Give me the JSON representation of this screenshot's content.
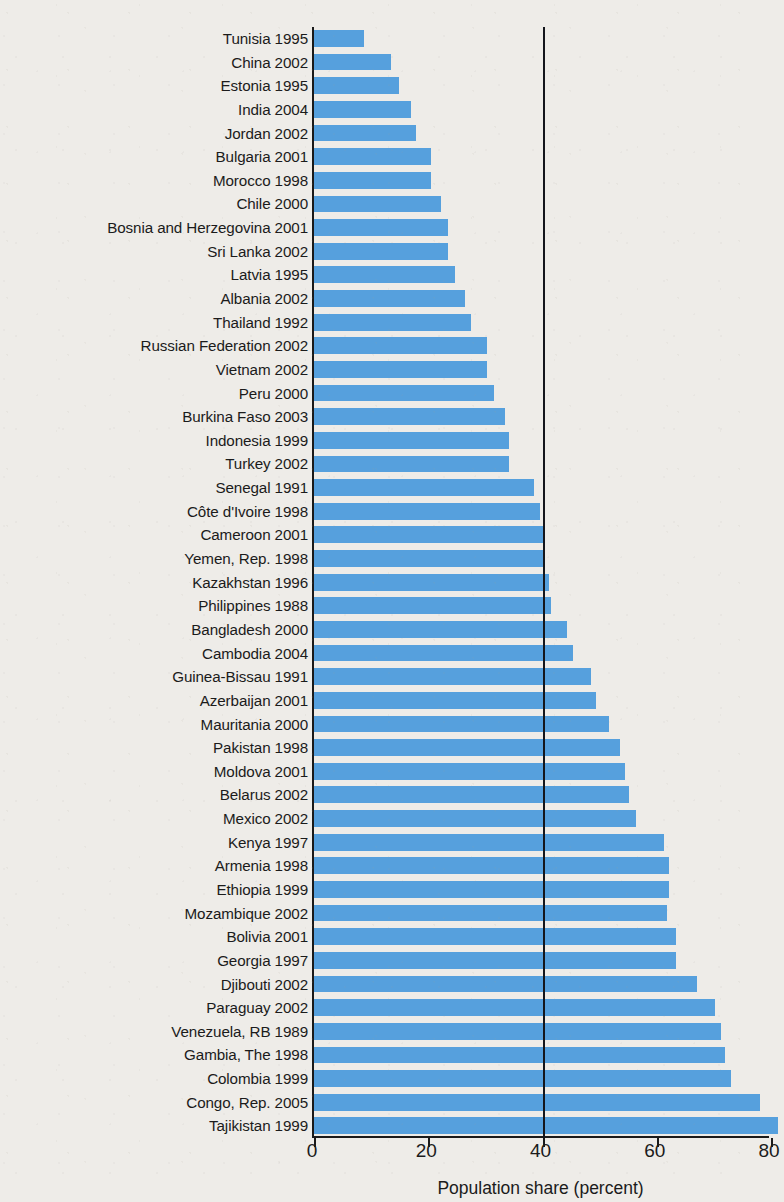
{
  "chart_data": {
    "type": "bar",
    "orientation": "horizontal",
    "title": "",
    "subtitle": "",
    "xlabel": "Population share (percent)",
    "ylabel": "",
    "xlim": [
      0,
      80
    ],
    "xticks": [
      0,
      20,
      40,
      60,
      80
    ],
    "xtick_labels": [
      "0",
      "20",
      "40",
      "60",
      "80"
    ],
    "grid": false,
    "legend": null,
    "bar_color": "#56a0dd",
    "axis_color": "#1a1a1a",
    "background_color": "#eeece8",
    "annotations": [
      {
        "type": "vertical-reference-line",
        "value": 40,
        "color": "#14161c"
      }
    ],
    "categories": [
      "Tunisia 1995",
      "China 2002",
      "Estonia 1995",
      "India 2004",
      "Jordan 2002",
      "Bulgaria 2001",
      "Morocco 1998",
      "Chile 2000",
      "Bosnia and Herzegovina 2001",
      "Sri Lanka 2002",
      "Latvia 1995",
      "Albania 2002",
      "Thailand 1992",
      "Russian Federation 2002",
      "Vietnam 2002",
      "Peru 2000",
      "Burkina Faso 2003",
      "Indonesia 1999",
      "Turkey 2002",
      "Senegal 1991",
      "Côte d'Ivoire 1998",
      "Cameroon 2001",
      "Yemen, Rep. 1998",
      "Kazakhstan 1996",
      "Philippines 1988",
      "Bangladesh 2000",
      "Cambodia 2004",
      "Guinea-Bissau 1991",
      "Azerbaijan 2001",
      "Mauritania 2000",
      "Pakistan 1998",
      "Moldova 2001",
      "Belarus 2002",
      "Mexico 2002",
      "Kenya 1997",
      "Armenia 1998",
      "Ethiopia 1999",
      "Mozambique 2002",
      "Bolivia 2001",
      "Georgia 1997",
      "Djibouti 2002",
      "Paraguay 2002",
      "Venezuela, RB 1989",
      "Gambia, The 1998",
      "Colombia 1999",
      "Congo, Rep. 2005",
      "Tajikistan 1999"
    ],
    "values": [
      8.8,
      13.5,
      14.8,
      17.0,
      17.8,
      20.4,
      20.5,
      22.3,
      23.4,
      23.4,
      24.6,
      26.4,
      27.5,
      30.2,
      30.3,
      31.5,
      33.4,
      34.1,
      34.2,
      38.5,
      39.6,
      40.3,
      40.5,
      41.2,
      41.5,
      44.3,
      45.4,
      48.5,
      49.4,
      51.6,
      53.6,
      54.4,
      55.2,
      56.3,
      61.3,
      62.1,
      62.2,
      61.8,
      63.4,
      63.4,
      67.0,
      70.2,
      71.3,
      72.0,
      73.0,
      78.1,
      81.3
    ]
  }
}
